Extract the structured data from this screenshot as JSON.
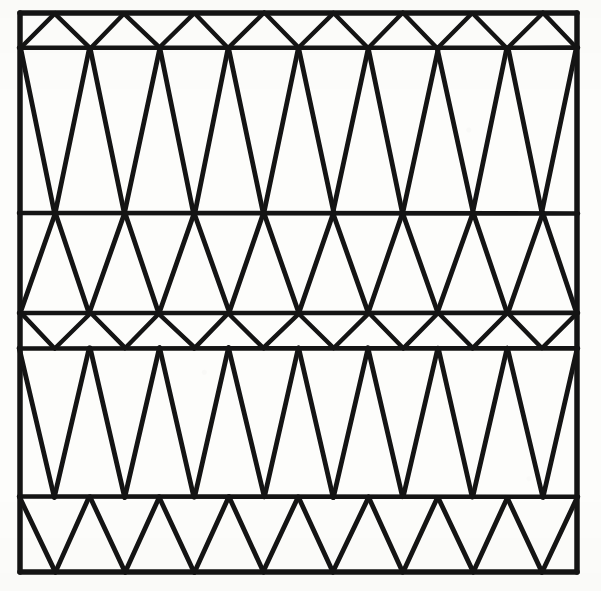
{
  "figure": {
    "title": "Triangulated zigzag lattice pattern",
    "media": "black ink line drawing on off-white scanned paper",
    "ink_color": "#141414",
    "paper_color": "#fdfdfb"
  },
  "canvas": {
    "width": 601,
    "height": 591
  },
  "frame": {
    "label": "outer rectangle border",
    "x0": 20,
    "y0": 13,
    "x1": 577,
    "y1": 572,
    "stroke_width": 5.5
  },
  "rules": {
    "label": "horizontal divider rules",
    "y_values": [
      48,
      213,
      313,
      348,
      497
    ],
    "stroke_width": 4.6
  },
  "bands": [
    {
      "name": "band-1-top-thin",
      "y_top": 13,
      "y_bottom": 48,
      "height": 35,
      "zigzag_periods": 8,
      "phase": "apex-up",
      "note": "shallow band of small triangles, apexes touching the top border"
    },
    {
      "name": "band-2-tall-upper",
      "y_top": 48,
      "y_bottom": 213,
      "height": 165,
      "zigzag_periods": 8,
      "phase": "apex-down",
      "note": "tallest band; long slender triangles alternating up and down"
    },
    {
      "name": "band-3-medium",
      "y_top": 213,
      "y_bottom": 313,
      "height": 100,
      "zigzag_periods": 8,
      "phase": "apex-up",
      "note": "medium height triangles"
    },
    {
      "name": "band-4-thin-middle",
      "y_top": 313,
      "y_bottom": 348,
      "height": 35,
      "zigzag_periods": 8,
      "phase": "apex-down",
      "note": "narrow band of flat wide triangles between two close rules"
    },
    {
      "name": "band-5-tall-lower",
      "y_top": 348,
      "y_bottom": 497,
      "height": 149,
      "zigzag_periods": 8,
      "phase": "apex-down",
      "note": "second tall band of long slender triangles"
    },
    {
      "name": "band-6-bottom",
      "y_top": 497,
      "y_bottom": 572,
      "height": 75,
      "zigzag_periods": 8,
      "phase": "apex-down",
      "note": "bottom band of triangles, apexes touching the bottom border"
    }
  ],
  "lattice": {
    "columns": 8,
    "node_spacing_px": 69.6,
    "total_bands": 6,
    "total_triangles": 96
  }
}
